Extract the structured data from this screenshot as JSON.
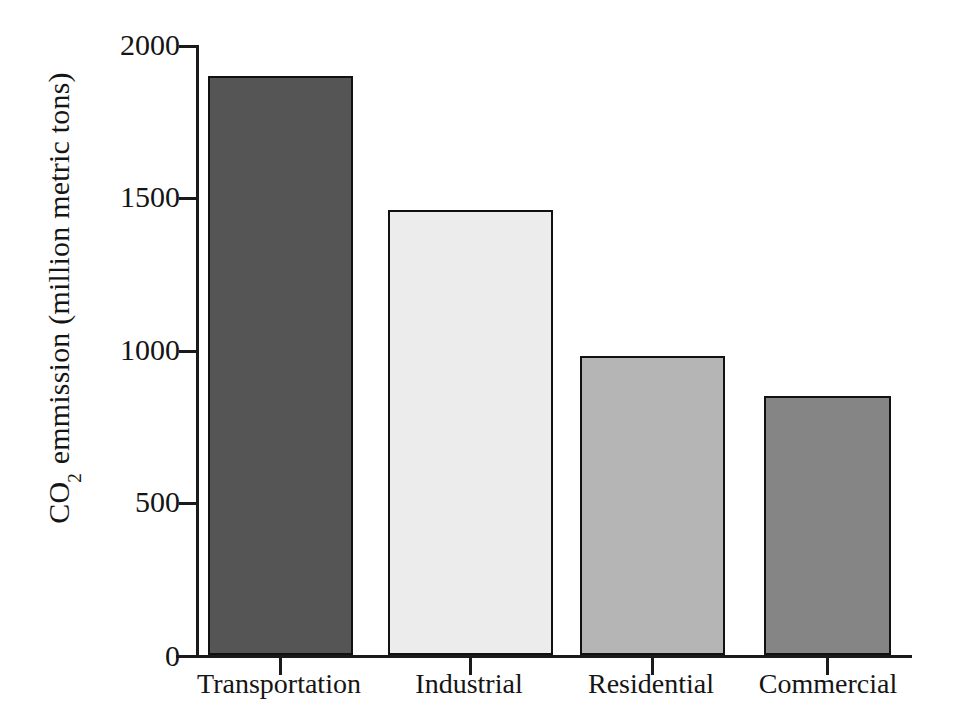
{
  "chart_data": {
    "type": "bar",
    "title": "",
    "subtitle": "",
    "xlabel": "",
    "ylabel": "CO2 emmission (million metric tons)",
    "ylabel_prefix": "CO",
    "ylabel_subscript": "2",
    "ylabel_suffix": " emmission (million metric tons)",
    "categories": [
      "Transportation",
      "Industrial",
      "Residential",
      "Commercial"
    ],
    "values": [
      1900,
      1460,
      980,
      850
    ],
    "series": [
      {
        "name": "CO2 emmission",
        "values": [
          1900,
          1460,
          980,
          850
        ]
      }
    ],
    "bar_colors": [
      "#555555",
      "#ececec",
      "#b5b5b5",
      "#858585"
    ],
    "bar_border_color": "#111111",
    "ylim": [
      0,
      2000
    ],
    "ytick_values": [
      0,
      500,
      1000,
      1500,
      2000
    ],
    "ytick_labels": [
      "0",
      "500",
      "1000",
      "1500",
      "2000"
    ],
    "grid": false,
    "legend": false,
    "legend_position": "none",
    "axis_color": "#1a1a1a",
    "background_color": "#ffffff"
  }
}
